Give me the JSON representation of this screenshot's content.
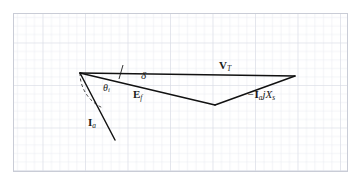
{
  "figure": {
    "kind": "phasor-diagram",
    "frame": {
      "grid_color": "#e4e6ec",
      "grid_major_color": "#dadde5",
      "background": "#ffffff",
      "line_color": "#1a1a1a",
      "grid_left": 13,
      "grid_top": 13,
      "grid_right": 348,
      "grid_bottom": 172,
      "grid_cell_px": 8.5
    },
    "vertices": {
      "origin": {
        "x": 80,
        "y": 73,
        "name": "origin-vertex"
      },
      "vt_tip": {
        "x": 295,
        "y": 76,
        "name": "vt-tip-vertex"
      },
      "ef_tip": {
        "x": 215,
        "y": 105,
        "name": "ef-tip-vertex"
      },
      "ia_tip": {
        "x": 115,
        "y": 140,
        "name": "ia-tip-vertex"
      }
    },
    "phasors": [
      {
        "id": "vt",
        "label": "V_T",
        "from": "origin",
        "to": "vt_tip"
      },
      {
        "id": "ef",
        "label": "E_f",
        "from": "origin",
        "to": "ef_tip"
      },
      {
        "id": "iajx",
        "label": "-I_a jX_s",
        "from": "ef_tip",
        "to": "vt_tip"
      },
      {
        "id": "ia",
        "label": "I_a",
        "from": "origin",
        "to": "ia_tip"
      }
    ],
    "labels": {
      "vt": {
        "main": "V",
        "sub": "T",
        "text": "V_T"
      },
      "iajx": {
        "sign": "−",
        "main": "I",
        "sub": "a",
        "mid": "jX",
        "sub2": "s",
        "text": "-I_a jX_s"
      },
      "ef": {
        "main": "E",
        "sub": "f",
        "text": "E_f"
      },
      "delta": {
        "text": "δ"
      },
      "theta": {
        "main": "θ",
        "sub": "i",
        "text": "θ_i"
      },
      "ia": {
        "main": "I",
        "sub": "a",
        "text": "I_a"
      }
    },
    "annotations": {
      "theta_arc": {
        "name": "theta-angle-arc",
        "style": "dashed",
        "center_x": 80,
        "center_y": 73,
        "radius": 38
      },
      "delta_tick": {
        "name": "delta-angle-tick",
        "x1": 123,
        "y1": 66,
        "x2": 119,
        "y2": 79
      }
    }
  }
}
